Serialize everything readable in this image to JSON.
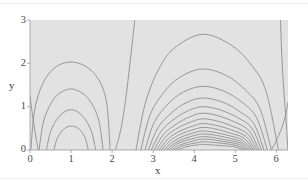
{
  "figure": {
    "name": "contour-plot",
    "background_color": "#ffffff",
    "plot_fill_color": "#e2e2e2",
    "contour_color": "#8a8a8a",
    "axis_color": "#9a9a9a",
    "text_color": "#3f3f3f"
  },
  "axes": {
    "x": {
      "label": "x",
      "ticks": [
        "0",
        "1",
        "2",
        "3",
        "4",
        "5",
        "6"
      ],
      "tick_values": [
        0,
        1,
        2,
        3,
        4,
        5,
        6
      ],
      "min": 0,
      "max": 6.283
    },
    "y": {
      "label": "y",
      "ticks": [
        "0",
        "1",
        "2",
        "3"
      ],
      "tick_values": [
        0,
        1,
        2,
        3
      ],
      "min": 0,
      "max": 3
    }
  },
  "chart_data": {
    "type": "line",
    "title": "",
    "xlabel": "x",
    "ylabel": "y",
    "xlim": [
      0,
      6.283
    ],
    "ylim": [
      0,
      3
    ],
    "grid": false,
    "legend": null,
    "series": [
      {
        "name": "left-lobe-contour-1",
        "kind": "closed-loop",
        "center_x": 1.0,
        "apex_y": 2.03,
        "x_extent": [
          0.02,
          1.95
        ],
        "x": [
          0.02,
          0.1,
          0.25,
          0.45,
          0.7,
          1.0,
          1.3,
          1.55,
          1.75,
          1.88,
          1.95
        ],
        "y": [
          0.0,
          0.85,
          1.4,
          1.75,
          1.96,
          2.03,
          1.96,
          1.78,
          1.48,
          1.0,
          0.0
        ]
      },
      {
        "name": "left-lobe-contour-2",
        "kind": "closed-loop",
        "center_x": 1.0,
        "apex_y": 1.41,
        "x_extent": [
          0.22,
          1.78
        ],
        "x": [
          0.22,
          0.32,
          0.48,
          0.68,
          1.0,
          1.32,
          1.52,
          1.68,
          1.78
        ],
        "y": [
          0.0,
          0.62,
          1.02,
          1.28,
          1.41,
          1.28,
          1.04,
          0.66,
          0.0
        ]
      },
      {
        "name": "left-lobe-contour-3",
        "kind": "closed-loop",
        "center_x": 1.0,
        "apex_y": 0.93,
        "x_extent": [
          0.4,
          1.6
        ],
        "x": [
          0.4,
          0.5,
          0.65,
          0.82,
          1.0,
          1.18,
          1.35,
          1.5,
          1.6
        ],
        "y": [
          0.0,
          0.42,
          0.7,
          0.87,
          0.93,
          0.87,
          0.7,
          0.42,
          0.0
        ]
      },
      {
        "name": "left-lobe-contour-4",
        "kind": "closed-loop",
        "center_x": 1.0,
        "apex_y": 0.55,
        "x_extent": [
          0.58,
          1.42
        ],
        "x": [
          0.58,
          0.66,
          0.78,
          0.9,
          1.0,
          1.12,
          1.24,
          1.35,
          1.42
        ],
        "y": [
          0.0,
          0.26,
          0.44,
          0.53,
          0.55,
          0.53,
          0.44,
          0.26,
          0.0
        ]
      },
      {
        "name": "left-edge-open-contour",
        "kind": "open",
        "x": [
          0.0,
          0.04,
          0.1,
          0.16,
          0.2
        ],
        "y": [
          1.26,
          0.95,
          0.55,
          0.22,
          0.0
        ]
      },
      {
        "name": "separatrix-left",
        "kind": "open",
        "x": [
          2.55,
          2.5,
          2.44,
          2.38,
          2.32,
          2.26,
          2.18,
          2.08
        ],
        "y": [
          3.0,
          2.55,
          2.05,
          1.55,
          1.1,
          0.72,
          0.34,
          0.0
        ]
      },
      {
        "name": "right-lobe-contour-1",
        "kind": "arc",
        "center_x": 4.2,
        "apex_y": 2.67,
        "x_extent": [
          2.58,
          6.05
        ],
        "x": [
          2.58,
          2.8,
          3.1,
          3.5,
          4.2,
          4.9,
          5.4,
          5.75,
          6.05
        ],
        "y": [
          0.0,
          1.05,
          1.8,
          2.34,
          2.67,
          2.42,
          1.95,
          1.35,
          0.0
        ]
      },
      {
        "name": "right-lobe-contour-2",
        "kind": "arc",
        "center_x": 4.2,
        "apex_y": 1.87,
        "x_extent": [
          2.7,
          5.88
        ],
        "x": [
          2.7,
          2.92,
          3.25,
          3.65,
          4.2,
          4.78,
          5.25,
          5.6,
          5.88
        ],
        "y": [
          0.0,
          0.8,
          1.32,
          1.68,
          1.87,
          1.72,
          1.38,
          0.95,
          0.0
        ]
      },
      {
        "name": "right-lobe-contour-3",
        "kind": "arc",
        "center_x": 4.2,
        "apex_y": 1.47,
        "x_extent": [
          2.8,
          5.78
        ],
        "x": [
          2.8,
          3.02,
          3.35,
          3.72,
          4.2,
          4.72,
          5.18,
          5.52,
          5.78
        ],
        "y": [
          0.0,
          0.63,
          1.05,
          1.33,
          1.47,
          1.36,
          1.09,
          0.74,
          0.0
        ]
      },
      {
        "name": "right-lobe-contour-4",
        "kind": "arc",
        "center_x": 4.2,
        "apex_y": 1.2,
        "x_extent": [
          2.88,
          5.7
        ],
        "x": [
          2.88,
          3.12,
          3.45,
          3.8,
          4.2,
          4.68,
          5.1,
          5.45,
          5.7
        ],
        "y": [
          0.0,
          0.52,
          0.86,
          1.09,
          1.2,
          1.11,
          0.89,
          0.61,
          0.0
        ]
      },
      {
        "name": "right-lobe-contour-5",
        "kind": "arc",
        "center_x": 4.2,
        "apex_y": 1.0,
        "x_extent": [
          2.95,
          5.64
        ],
        "x": [
          2.95,
          3.2,
          3.52,
          3.86,
          4.2,
          4.62,
          5.05,
          5.4,
          5.64
        ],
        "y": [
          0.0,
          0.44,
          0.72,
          0.91,
          1.0,
          0.93,
          0.75,
          0.51,
          0.0
        ]
      },
      {
        "name": "right-lobe-contour-6",
        "kind": "arc",
        "center_x": 4.2,
        "apex_y": 0.85,
        "x_extent": [
          3.02,
          5.58
        ],
        "x": [
          3.02,
          3.26,
          3.58,
          3.9,
          4.2,
          4.58,
          5.0,
          5.34,
          5.58
        ],
        "y": [
          0.0,
          0.37,
          0.61,
          0.77,
          0.85,
          0.79,
          0.64,
          0.44,
          0.0
        ]
      },
      {
        "name": "right-lobe-contour-7",
        "kind": "arc",
        "center_x": 4.2,
        "apex_y": 0.72,
        "x_extent": [
          3.08,
          5.53
        ],
        "x": [
          3.08,
          3.32,
          3.62,
          3.93,
          4.2,
          4.55,
          4.95,
          5.3,
          5.53
        ],
        "y": [
          0.0,
          0.32,
          0.52,
          0.65,
          0.72,
          0.67,
          0.54,
          0.37,
          0.0
        ]
      },
      {
        "name": "right-lobe-contour-8",
        "kind": "arc",
        "center_x": 4.2,
        "apex_y": 0.61,
        "x_extent": [
          3.14,
          5.48
        ],
        "x": [
          3.14,
          3.38,
          3.66,
          3.96,
          4.2,
          4.52,
          4.92,
          5.26,
          5.48
        ],
        "y": [
          0.0,
          0.27,
          0.44,
          0.55,
          0.61,
          0.57,
          0.46,
          0.31,
          0.0
        ]
      },
      {
        "name": "right-lobe-contour-9",
        "kind": "arc",
        "center_x": 4.2,
        "apex_y": 0.52,
        "x_extent": [
          3.2,
          5.44
        ],
        "x": [
          3.2,
          3.43,
          3.7,
          3.98,
          4.2,
          4.5,
          4.88,
          5.22,
          5.44
        ],
        "y": [
          0.0,
          0.23,
          0.38,
          0.47,
          0.52,
          0.49,
          0.39,
          0.27,
          0.0
        ]
      },
      {
        "name": "right-lobe-contour-10",
        "kind": "arc",
        "center_x": 4.2,
        "apex_y": 0.44,
        "x_extent": [
          3.26,
          5.4
        ],
        "x": [
          3.26,
          3.48,
          3.74,
          4.0,
          4.2,
          4.48,
          4.85,
          5.18,
          5.4
        ],
        "y": [
          0.0,
          0.19,
          0.32,
          0.4,
          0.44,
          0.41,
          0.33,
          0.23,
          0.0
        ]
      },
      {
        "name": "right-lobe-contour-11",
        "kind": "arc",
        "center_x": 4.2,
        "apex_y": 0.37,
        "x_extent": [
          3.32,
          5.36
        ],
        "x": [
          3.32,
          3.53,
          3.78,
          4.02,
          4.2,
          4.46,
          4.82,
          5.15,
          5.36
        ],
        "y": [
          0.0,
          0.16,
          0.27,
          0.34,
          0.37,
          0.35,
          0.28,
          0.19,
          0.0
        ]
      },
      {
        "name": "right-lobe-contour-12",
        "kind": "arc",
        "center_x": 4.2,
        "apex_y": 0.31,
        "x_extent": [
          3.38,
          5.32
        ],
        "x": [
          3.38,
          3.58,
          3.82,
          4.04,
          4.2,
          4.44,
          4.78,
          5.12,
          5.32
        ],
        "y": [
          0.0,
          0.14,
          0.23,
          0.28,
          0.31,
          0.29,
          0.23,
          0.16,
          0.0
        ]
      },
      {
        "name": "right-lobe-contour-13",
        "kind": "arc",
        "center_x": 4.2,
        "apex_y": 0.25,
        "x_extent": [
          3.45,
          5.28
        ],
        "x": [
          3.45,
          3.64,
          3.86,
          4.06,
          4.2,
          4.42,
          4.75,
          5.08,
          5.28
        ],
        "y": [
          0.0,
          0.11,
          0.18,
          0.23,
          0.25,
          0.24,
          0.19,
          0.13,
          0.0
        ]
      },
      {
        "name": "right-lobe-contour-14",
        "kind": "arc",
        "center_x": 4.2,
        "apex_y": 0.19,
        "x_extent": [
          3.52,
          5.24
        ],
        "x": [
          3.52,
          3.7,
          3.9,
          4.08,
          4.2,
          4.4,
          4.72,
          5.04,
          5.24
        ],
        "y": [
          0.0,
          0.09,
          0.14,
          0.17,
          0.19,
          0.18,
          0.15,
          0.1,
          0.0
        ]
      },
      {
        "name": "right-lobe-contour-15",
        "kind": "arc",
        "center_x": 4.2,
        "apex_y": 0.13,
        "x_extent": [
          3.6,
          5.18
        ],
        "x": [
          3.6,
          3.76,
          3.94,
          4.1,
          4.2,
          4.38,
          4.68,
          5.0,
          5.18
        ],
        "y": [
          0.0,
          0.06,
          0.1,
          0.12,
          0.13,
          0.12,
          0.1,
          0.07,
          0.0
        ]
      },
      {
        "name": "separatrix-right",
        "kind": "open",
        "x": [
          6.1,
          6.12,
          6.15,
          6.19,
          6.24,
          6.28
        ],
        "y": [
          3.0,
          2.45,
          1.85,
          1.25,
          0.62,
          0.0
        ]
      },
      {
        "name": "right-edge-open-contour",
        "kind": "open",
        "x": [
          6.28,
          6.22,
          6.12,
          6.0,
          5.88
        ],
        "y": [
          1.1,
          0.78,
          0.48,
          0.22,
          0.0
        ]
      }
    ]
  }
}
